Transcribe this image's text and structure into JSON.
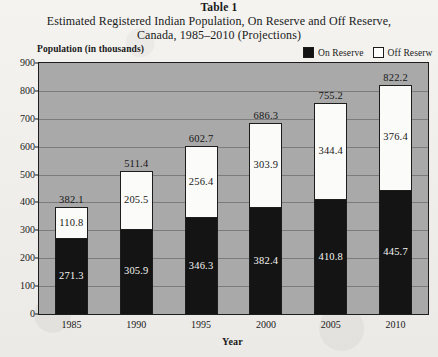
{
  "title": {
    "table_label": "Table 1",
    "line1": "Estimated Registered Indian Population, On Reserve and Off Reserve,",
    "line2": "Canada, 1985–2010 (Projections)"
  },
  "legend": {
    "items": [
      {
        "label": "On Reserve",
        "color": "#131313"
      },
      {
        "label": "Off Reserw",
        "color": "#fdfdfb"
      }
    ]
  },
  "axes": {
    "y_title": "Population (in thousands)",
    "x_title": "Year"
  },
  "chart_data": {
    "type": "bar",
    "stacked": true,
    "title": "Estimated Registered Indian Population, On Reserve and Off Reserve, Canada, 1985–2010 (Projections)",
    "xlabel": "Year",
    "ylabel": "Population (in thousands)",
    "ylim": [
      0,
      900
    ],
    "ytick_step": 100,
    "yticks": [
      "900",
      "800",
      "700",
      "600",
      "500",
      "400",
      "300",
      "200",
      "100",
      "0"
    ],
    "grid": true,
    "legend_position": "top-right",
    "categories": [
      "1985",
      "1990",
      "1995",
      "2000",
      "2005",
      "2010"
    ],
    "series": [
      {
        "name": "On Reserve",
        "color": "#141414",
        "values": [
          271.3,
          305.9,
          346.3,
          382.4,
          410.8,
          445.7
        ]
      },
      {
        "name": "Off Reserve",
        "color": "#fbfbf9",
        "values": [
          110.8,
          205.5,
          256.4,
          303.9,
          344.4,
          376.4
        ]
      }
    ],
    "totals": [
      382.1,
      511.4,
      602.7,
      686.3,
      755.2,
      822.2
    ],
    "value_labels": {
      "on_reserve": [
        "271.3",
        "305.9",
        "346.3",
        "382.4",
        "410.8",
        "445.7"
      ],
      "off_reserve": [
        "110.8",
        "205.5",
        "256.4",
        "303.9",
        "344.4",
        "376.4"
      ],
      "totals": [
        "382.1",
        "511.4",
        "602.7",
        "686.3",
        "755.2",
        "822.2"
      ]
    }
  }
}
